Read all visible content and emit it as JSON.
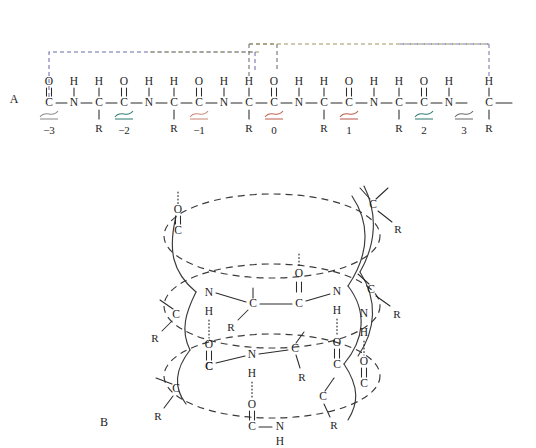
{
  "figure": {
    "background": "#ffffff",
    "panels": [
      {
        "id": "A",
        "label": "A",
        "caption": "extended polypeptide backbone"
      },
      {
        "id": "B",
        "label": "B",
        "caption": "alpha helix perspective view"
      }
    ]
  },
  "panel_a": {
    "label": "A",
    "atoms": {
      "carbon": "C",
      "nitrogen": "N",
      "oxygen": "O",
      "hydrogen": "H",
      "sidechain": "R"
    },
    "residue_labels": [
      "−3",
      "−2",
      "−1",
      "0",
      "1",
      "2",
      "3"
    ],
    "brace_colors": [
      "#8c8c8c",
      "#2f7d72",
      "#c98878",
      "#c4614f",
      "#bb5a4c",
      "#2f7d72",
      "#6b6b6b"
    ],
    "terminal_bond_color": "#9b6fc4",
    "hbond_colors": {
      "left": "#6d6fae",
      "mid": "#9a9560",
      "right": "#7a7ab0",
      "inner": "#6b6b6b"
    },
    "repeat_unit": [
      "C",
      "N",
      "C",
      "C",
      "N",
      "C"
    ],
    "carbonyl_label": "O",
    "amide_label": "H",
    "alpha_label": "H",
    "sidechain_label": "R"
  },
  "panel_b": {
    "label": "B",
    "atoms": {
      "carbon": "C",
      "nitrogen": "N",
      "oxygen": "O",
      "hydrogen": "H",
      "sidechain": "R"
    },
    "hbond_style": "dotted",
    "highlight_bond_color": "#2f8d80",
    "ring_count": 3,
    "description": "helical backbone with N–H···O=C hydrogen bonds"
  }
}
